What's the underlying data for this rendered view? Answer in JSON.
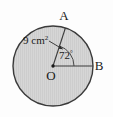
{
  "figure": {
    "background_color": "#fdfdfd",
    "circle": {
      "fill_color": "#d4d4d4",
      "stroke_color": "#3a3a3a",
      "center_label": "O",
      "center_x": 53,
      "center_y": 66,
      "radius_px": 40
    },
    "points": [
      {
        "name": "point-a",
        "label": "A",
        "x": 64,
        "y": 20
      },
      {
        "name": "point-b",
        "label": "B",
        "x": 99,
        "y": 67
      },
      {
        "name": "point-o",
        "label": "O",
        "x": 51,
        "y": 80
      }
    ],
    "radii": [
      {
        "name": "radius-oa",
        "from": "O",
        "to": "A",
        "measure": "9 cm"
      },
      {
        "name": "radius-ob",
        "from": "O",
        "to": "B"
      }
    ],
    "measure_label": {
      "value": "9 cm",
      "superscript": "2",
      "full": "9 cm"
    },
    "angle_label": {
      "value": "72",
      "degree_symbol": "°",
      "full": "72°"
    },
    "leader_arrow": {
      "name": "leader-arrow",
      "points_to": "radius-oa"
    },
    "stroke_color": "#3a3a3a"
  }
}
